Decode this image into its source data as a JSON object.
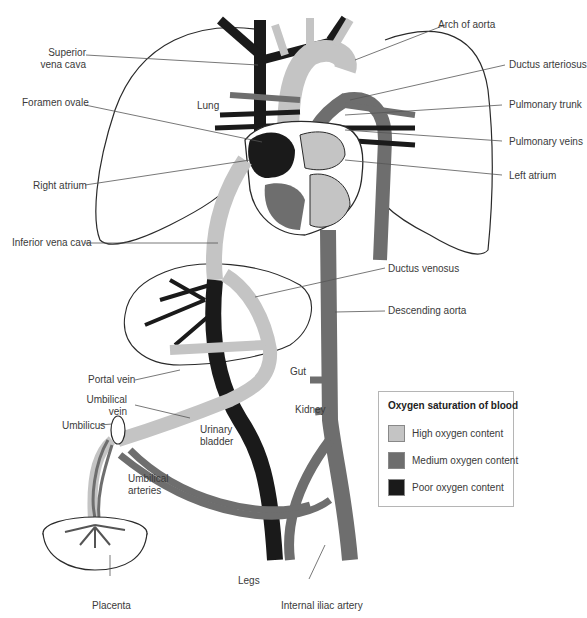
{
  "diagram": {
    "labels": {
      "superior_vena_cava": [
        "Superior",
        "vena cava"
      ],
      "foramen_ovale": "Foramen ovale",
      "lung": "Lung",
      "right_atrium": "Right atrium",
      "inferior_vena_cava": "Inferior vena cava",
      "portal_vein": "Portal vein",
      "umbilical_vein": [
        "Umbilical",
        "vein"
      ],
      "umbilicus": "Umbilicus",
      "umbilical_arteries": [
        "Umbilical",
        "arteries"
      ],
      "urinary_bladder": [
        "Urinary",
        "bladder"
      ],
      "placenta": "Placenta",
      "legs": "Legs",
      "internal_iliac_artery": "Internal iliac artery",
      "kidney": "Kidney",
      "gut": "Gut",
      "arch_of_aorta": "Arch of aorta",
      "ductus_arteriosus": "Ductus arteriosus",
      "pulmonary_trunk": "Pulmonary trunk",
      "pulmonary_veins": "Pulmonary veins",
      "left_atrium": "Left atrium",
      "ductus_venosus": "Ductus venosus",
      "descending_aorta": "Descending aorta"
    },
    "legend": {
      "title": "Oxygen saturation of blood",
      "items": [
        {
          "label": "High oxygen content",
          "color": "#c4c4c4"
        },
        {
          "label": "Medium oxygen content",
          "color": "#6e6e6e"
        },
        {
          "label": "Poor oxygen content",
          "color": "#1a1a1a"
        }
      ]
    },
    "colors": {
      "high": "#c4c4c4",
      "medium": "#6e6e6e",
      "poor": "#1a1a1a",
      "outline": "#2a2a2a",
      "leader": "#555555"
    }
  }
}
